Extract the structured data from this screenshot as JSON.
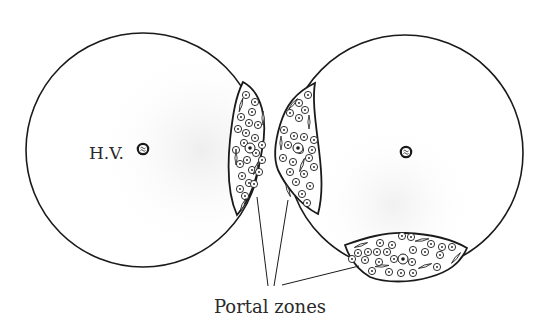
{
  "diagram": {
    "type": "anatomical-schematic",
    "colors": {
      "stroke": "#1a1a1a",
      "background": "#ffffff",
      "text": "#2a2a2a",
      "shade": "#eeeeee"
    },
    "nodes": [
      {
        "id": "lobule-left",
        "shape": "circle",
        "cx": 143,
        "cy": 150,
        "r": 117
      },
      {
        "id": "lobule-right",
        "shape": "circle",
        "cx": 405,
        "cy": 153,
        "r": 118
      },
      {
        "id": "central-vein-left",
        "shape": "small-circle",
        "cx": 143,
        "cy": 149,
        "r": 5
      },
      {
        "id": "central-vein-right",
        "shape": "small-circle",
        "cx": 406,
        "cy": 152,
        "r": 5
      },
      {
        "id": "portal-zone-left",
        "shape": "lens"
      },
      {
        "id": "portal-zone-middle",
        "shape": "lens"
      },
      {
        "id": "portal-zone-bottom",
        "shape": "lens"
      }
    ],
    "labels": {
      "central_vein": "H.V.",
      "portal_zones": "Portal zones"
    },
    "leader_lines": [
      {
        "from": "portal-zone-left",
        "to": "portal-zones-label"
      },
      {
        "from": "portal-zone-middle",
        "to": "portal-zones-label"
      },
      {
        "from": "portal-zone-bottom",
        "to": "portal-zones-label"
      }
    ]
  }
}
